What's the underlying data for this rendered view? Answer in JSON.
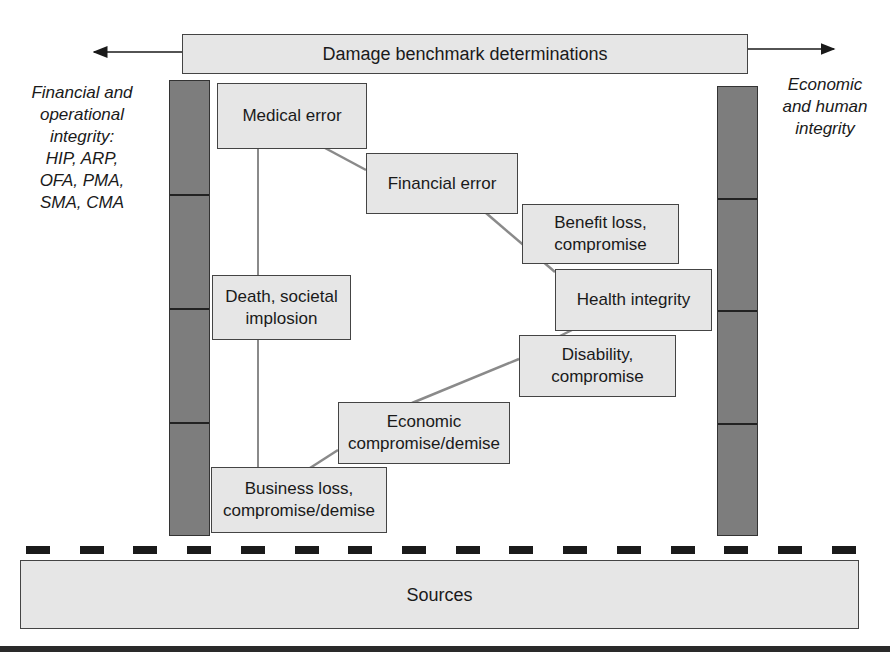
{
  "diagram": {
    "banner": {
      "label": "Damage benchmark determinations"
    },
    "left_label": {
      "lines": [
        "Financial and",
        "operational",
        "integrity:",
        "HIP, ARP,",
        "OFA, PMA,",
        "SMA, CMA"
      ]
    },
    "right_label": {
      "lines": [
        "Economic",
        "and human",
        "integrity"
      ]
    },
    "left_bar": {
      "segments": 4
    },
    "right_bar": {
      "segments": 4
    },
    "nodes": {
      "medical_error": {
        "label": "Medical error"
      },
      "financial_error": {
        "label": "Financial error"
      },
      "benefit_loss": {
        "line1": "Benefit loss,",
        "line2": "compromise"
      },
      "health_integrity": {
        "label": "Health integrity"
      },
      "disability": {
        "line1": "Disability,",
        "line2": "compromise"
      },
      "economic": {
        "line1": "Economic",
        "line2": "compromise/demise"
      },
      "death": {
        "line1": "Death, societal",
        "line2": "implosion"
      },
      "business_loss": {
        "line1": "Business loss,",
        "line2": "compromise/demise"
      }
    },
    "sources": {
      "label": "Sources"
    },
    "dash_count": 16,
    "colors": {
      "box_fill": "#e6e6e6",
      "bar_fill": "#7d7d7d",
      "connector": "#8a8a8a",
      "outline": "#444444"
    }
  }
}
